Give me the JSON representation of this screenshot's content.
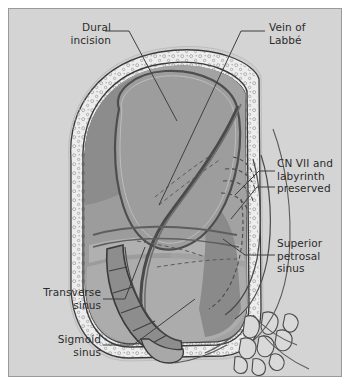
{
  "figure": {
    "kind": "anatomical-illustration",
    "background_color": "#d4d4d4",
    "border_color": "#9a9a9a",
    "ink_color": "#2b2b2b"
  },
  "labels": [
    {
      "id": "dural",
      "text": "Dural\nincision",
      "align": "right"
    },
    {
      "id": "labbe",
      "text": "Vein of\nLabbé",
      "align": "left"
    },
    {
      "id": "cnvii",
      "text": "CN VII and\nlabyrinth\npreserved",
      "align": "left"
    },
    {
      "id": "sps",
      "text": "Superior\npetrosal\nsinus",
      "align": "left"
    },
    {
      "id": "trans",
      "text": "Transverse\nsinus",
      "align": "right"
    },
    {
      "id": "sig",
      "text": "Sigmoid\nsinus",
      "align": "right"
    }
  ],
  "palette": {
    "background": "#d4d4d4",
    "bone_fill": "#ececec",
    "bone_stipple": "#b9b9b9",
    "dura_dark": "#545454",
    "brain_mid": "#9a9a9a",
    "brain_light": "#b0b0b0",
    "brain_dark": "#7d7d7d",
    "sinus_fill": "#8a8a8a",
    "sinus_dark": "#6e6e6e",
    "outline": "#3a3a3a",
    "leader": "#4a4a4a"
  },
  "structures": [
    "temporal bone (stippled)",
    "dura mater",
    "temporal lobe / cerebellum",
    "transverse sinus",
    "sigmoid sinus",
    "superior petrosal sinus",
    "vein of Labbé",
    "labyrinth (dashed)",
    "mastoid air cells"
  ]
}
